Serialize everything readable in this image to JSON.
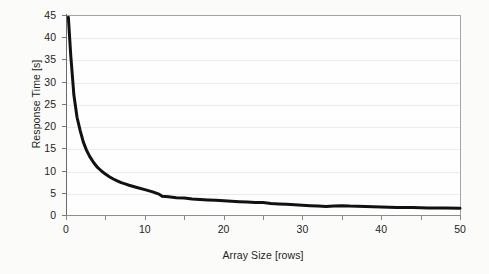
{
  "chart_data": {
    "type": "line",
    "title": "",
    "xlabel": "Array Size [rows]",
    "ylabel": "Response Time [s]",
    "xlim": [
      0,
      50
    ],
    "ylim": [
      0,
      45
    ],
    "grid": "horizontal",
    "legend": "none",
    "x_ticks": [
      "0",
      "10",
      "20",
      "30",
      "40",
      "50"
    ],
    "x_tick_values": [
      0,
      10,
      20,
      30,
      40,
      50
    ],
    "x_minor_tick_values": [
      5,
      15,
      25,
      35,
      45
    ],
    "y_ticks": [
      "0",
      "5",
      "10",
      "15",
      "20",
      "25",
      "30",
      "35",
      "40",
      "45"
    ],
    "y_tick_values": [
      0,
      5,
      10,
      15,
      20,
      25,
      30,
      35,
      40,
      45
    ],
    "series": [
      {
        "name": "Response Time",
        "color": "#111111",
        "line_width": 3,
        "x": [
          0.3,
          0.6,
          1.0,
          1.4,
          1.8,
          2.2,
          2.6,
          3.0,
          3.5,
          4.0,
          4.5,
          5.0,
          5.5,
          6.0,
          6.5,
          7.0,
          7.5,
          8.0,
          9.0,
          10.0,
          11.0,
          11.8,
          12.2,
          13.0,
          14.0,
          15.0,
          16.0,
          17.0,
          18.0,
          19.0,
          20.0,
          21.0,
          22.0,
          23.0,
          24.0,
          25.0,
          26.0,
          27.0,
          28.0,
          29.0,
          30.0,
          31.0,
          32.0,
          33.0,
          34.0,
          35.0,
          36.0,
          38.0,
          40.0,
          42.0,
          44.0,
          46.0,
          48.0,
          50.0
        ],
        "y": [
          44.5,
          36.0,
          27.0,
          22.0,
          19.0,
          16.4,
          14.6,
          13.2,
          11.8,
          10.7,
          9.9,
          9.2,
          8.6,
          8.1,
          7.7,
          7.3,
          7.0,
          6.7,
          6.2,
          5.7,
          5.2,
          4.7,
          4.2,
          4.1,
          3.9,
          3.8,
          3.6,
          3.5,
          3.4,
          3.3,
          3.2,
          3.1,
          3.0,
          2.9,
          2.8,
          2.8,
          2.6,
          2.5,
          2.4,
          2.3,
          2.2,
          2.1,
          2.0,
          1.9,
          2.0,
          2.1,
          2.0,
          1.9,
          1.8,
          1.7,
          1.7,
          1.6,
          1.6,
          1.5
        ]
      }
    ]
  }
}
